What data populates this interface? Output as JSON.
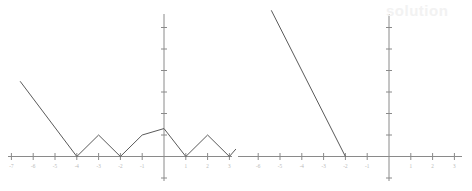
{
  "figure": {
    "background_color": "#ffffff",
    "axis_color": "#8a8a8a",
    "curve_color": "#5a5a5a",
    "tick_label_color": "#b9b9b9",
    "watermark_text": "solution",
    "watermark_color": "#f2f2f2",
    "panels": [
      {
        "id": "left-graph",
        "name": "piecewise-absolute-value-graph"
      },
      {
        "id": "right-graph",
        "name": "linear-function-graph"
      }
    ]
  },
  "chart_data": [
    {
      "type": "line",
      "id": "left-graph",
      "title": "",
      "xlabel": "",
      "ylabel": "",
      "xlim": [
        -7.2,
        3.2
      ],
      "ylim": [
        -1.2,
        7.2
      ],
      "grid": false,
      "legend": null,
      "origin": {
        "x": 0,
        "y": 0
      },
      "x_ticks": [
        -7,
        -6,
        -5,
        -4,
        -3,
        -2,
        -1,
        1,
        2,
        3
      ],
      "x_tick_labels": [
        "-7",
        "-6",
        "-5",
        "-4",
        "-3",
        "-2",
        "-1",
        "1",
        "2",
        "3"
      ],
      "y_ticks": [
        -1,
        1,
        2,
        3,
        4,
        5,
        6,
        7
      ],
      "y_tick_labels": [
        "",
        "",
        "",
        "",
        "",
        "",
        "",
        ""
      ],
      "series": [
        {
          "name": "f(x)",
          "x": [
            -6.6,
            -4.0,
            -3.0,
            -2.0,
            -1.0,
            0.0,
            1.0,
            2.0,
            3.0,
            3.3
          ],
          "y": [
            3.5,
            0.0,
            1.0,
            0.0,
            1.0,
            1.3,
            0.0,
            1.0,
            0.0,
            0.35
          ]
        }
      ]
    },
    {
      "type": "line",
      "id": "right-graph",
      "title": "",
      "xlabel": "",
      "ylabel": "",
      "xlim": [
        -7.2,
        3.2
      ],
      "ylim": [
        -1.2,
        7.2
      ],
      "grid": false,
      "legend": null,
      "origin": {
        "x": 0,
        "y": 0
      },
      "x_ticks": [
        -7,
        -6,
        -5,
        -4,
        -3,
        -2,
        -1,
        1,
        2,
        3
      ],
      "x_tick_labels": [
        "-7",
        "-6",
        "-5",
        "-4",
        "-3",
        "-2",
        "-1",
        "1",
        "2",
        "3"
      ],
      "y_ticks": [
        -1,
        1,
        2,
        3,
        4,
        5,
        6,
        7
      ],
      "y_tick_labels": [
        "",
        "",
        "",
        "",
        "",
        "",
        "",
        ""
      ],
      "series": [
        {
          "name": "g(x)",
          "x": [
            -5.4,
            -2.0
          ],
          "y": [
            6.8,
            0.0
          ]
        }
      ]
    }
  ]
}
